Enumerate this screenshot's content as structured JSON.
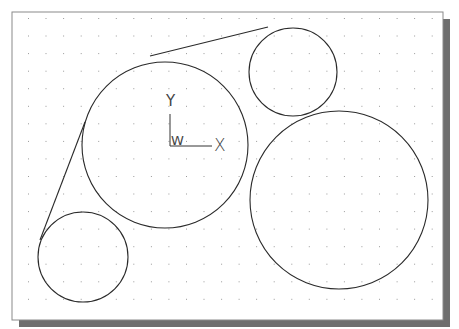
{
  "drawing": {
    "background": "#ffffff",
    "frame": {
      "x": 12,
      "y": 12,
      "w": 431,
      "h": 308,
      "stroke": "#8a8a8a"
    },
    "shadow": {
      "offset": 7,
      "color": "#6e6e6e"
    },
    "grid": {
      "x0": 28,
      "y0": 18,
      "dx": 17.55,
      "dy": 17.55,
      "cols": 24,
      "rows": 18,
      "color": "#9a9a9a"
    },
    "stroke": "#2a2a2a",
    "circles": [
      {
        "name": "large-center-circle",
        "cx": 165,
        "cy": 145,
        "r": 83
      },
      {
        "name": "small-top-right-circle",
        "cx": 293,
        "cy": 72,
        "r": 44
      },
      {
        "name": "large-bottom-right-circle",
        "cx": 339,
        "cy": 200,
        "r": 89
      },
      {
        "name": "small-bottom-left-circle",
        "cx": 83,
        "cy": 257,
        "r": 45
      }
    ],
    "lines": [
      {
        "name": "top-tangent-line",
        "x1": 150,
        "y1": 56,
        "x2": 268,
        "y2": 27
      },
      {
        "name": "left-tangent-line",
        "x1": 40,
        "y1": 240,
        "x2": 85,
        "y2": 122
      }
    ],
    "ucs_icon": {
      "origin_x": 170,
      "origin_y": 146,
      "x_axis_length": 42,
      "y_axis_length": 44,
      "x_label": "X",
      "y_label": "Y",
      "w_label": "W"
    }
  }
}
